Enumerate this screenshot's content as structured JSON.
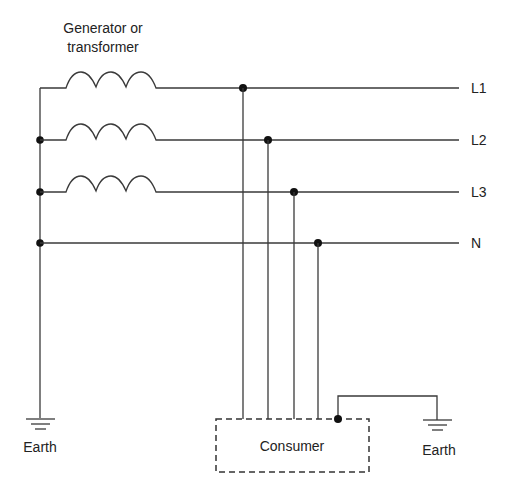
{
  "diagram": {
    "source_label_line1": "Generator or",
    "source_label_line2": "transformer",
    "conductors": [
      {
        "id": "L1",
        "label": "L1"
      },
      {
        "id": "L2",
        "label": "L2"
      },
      {
        "id": "L3",
        "label": "L3"
      },
      {
        "id": "N",
        "label": "N"
      }
    ],
    "consumer_label": "Consumer",
    "earth_left_label": "Earth",
    "earth_right_label": "Earth",
    "colors": {
      "line": "#3a3a3a",
      "node": "#111111",
      "text": "#222222",
      "background": "#ffffff"
    }
  }
}
